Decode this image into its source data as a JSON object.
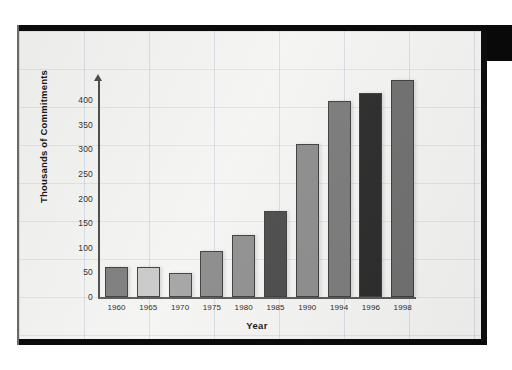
{
  "document": {
    "kind": "scanned-bar-chart-page",
    "frame_color": "#0b0b0b",
    "paper_color": "#f4f5f3",
    "grid_line_color": "#96a5b9"
  },
  "chart_data": {
    "type": "bar",
    "title": "",
    "xlabel": "Year",
    "ylabel": "Thousands of Commitments",
    "categories": [
      "1960",
      "1965",
      "1970",
      "1975",
      "1980",
      "1985",
      "1990",
      "1994",
      "1996",
      "1998"
    ],
    "values": [
      60,
      60,
      48,
      93,
      126,
      175,
      310,
      398,
      415,
      440
    ],
    "bar_colors": [
      "#7d7d7d",
      "#c9c9c9",
      "#a3a3a3",
      "#8a8a8a",
      "#8f8f8f",
      "#4a4a4a",
      "#8c8c8c",
      "#7a7a7a",
      "#2a2a2a",
      "#6f6f6f"
    ],
    "ylim": [
      0,
      450
    ],
    "yticks": [
      0,
      50,
      100,
      150,
      200,
      250,
      300,
      350,
      400
    ],
    "ytick_labels": [
      "0",
      "50",
      "100",
      "150",
      "200",
      "250",
      "300",
      "350",
      "400"
    ],
    "grid": true,
    "legend": null
  }
}
